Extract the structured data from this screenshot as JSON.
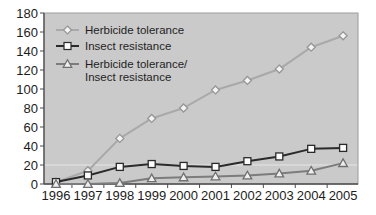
{
  "chart_data": {
    "type": "line",
    "title": "",
    "xlabel": "",
    "ylabel": "",
    "x_categories": [
      "1996",
      "1997",
      "1998",
      "1999",
      "2000",
      "2001",
      "2002",
      "2003",
      "2004",
      "2005"
    ],
    "y_ticks": [
      0,
      20,
      40,
      60,
      80,
      100,
      120,
      140,
      160,
      180
    ],
    "ylim": [
      0,
      180
    ],
    "gridlines_y": [
      20
    ],
    "grid": "minimal",
    "legend_position": "top-left-inside",
    "series": [
      {
        "name": "Herbicide tolerance",
        "legend_lines": [
          "Herbicide tolerance"
        ],
        "marker": "diamond",
        "line_color": "#a9a9a9",
        "marker_stroke": "#969696",
        "marker_fill": "#f4f4f4",
        "values": [
          2,
          14,
          48,
          69,
          80,
          99,
          109,
          121,
          144,
          156
        ]
      },
      {
        "name": "Insect resistance",
        "legend_lines": [
          "Insect resistance"
        ],
        "marker": "square",
        "line_color": "#2a2a2a",
        "marker_stroke": "#2a2a2a",
        "marker_fill": "#fdfdfd",
        "values": [
          2,
          9,
          18,
          21,
          19,
          18,
          24,
          29,
          37,
          38
        ]
      },
      {
        "name": "Herbicide tolerance/Insect resistance",
        "legend_lines": [
          "Herbicide tolerance/",
          "Insect resistance"
        ],
        "marker": "triangle",
        "line_color": "#7c7c7c",
        "marker_stroke": "#6f6f6f",
        "marker_fill": "#eeeeee",
        "values": [
          0,
          0,
          1,
          6,
          7,
          8,
          9,
          11,
          14,
          22
        ]
      }
    ],
    "colors": {
      "plot_bg": "#cacaca",
      "page_bg": "#ffffff",
      "axis_line": "#4c4c4c",
      "plot_border": "#9b9b9b",
      "tick_label": "#1c1c1c",
      "legend_text": "#1f1f1f",
      "gridline": "rgba(255,255,255,0.55)"
    }
  }
}
